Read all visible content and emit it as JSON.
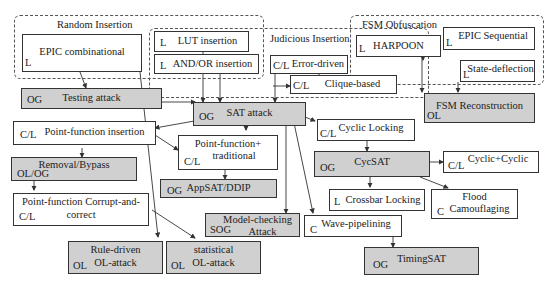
{
  "groups": {
    "random": "Random Insertion",
    "judicious": "Judicious Insertion",
    "fsm": "FSM Obfuscation"
  },
  "nodes": {
    "epic_comb": {
      "label": "EPIC combinational",
      "tag": "L"
    },
    "lut": {
      "label": "LUT insertion",
      "tag": "L"
    },
    "andor": {
      "label": "AND/OR insertion",
      "tag": "L"
    },
    "error_driven": {
      "label": "Error-driven",
      "tag": "C/L"
    },
    "clique": {
      "label": "Clique-based",
      "tag": "C/L"
    },
    "harpoon": {
      "label": "HARPOON",
      "tag": "L"
    },
    "epic_seq": {
      "label": "EPIC Sequential",
      "tag": "L"
    },
    "state_defl": {
      "label": "State-deflection",
      "tag": "L"
    },
    "testing": {
      "label": "Testing attack",
      "tag": "OG"
    },
    "sat": {
      "label": "SAT attack",
      "tag": "OG"
    },
    "fsm_recon": {
      "label": "FSM Reconstruction",
      "tag": "OL"
    },
    "pf_insert": {
      "label": "Point-function insertion",
      "tag": "C/L"
    },
    "pf_trad": {
      "label1": "Point-function+",
      "label2": "traditional",
      "tag": "C/L"
    },
    "cyclic": {
      "label": "Cyclic Locking",
      "tag": "C/L"
    },
    "removal": {
      "label": "Removal/Bypass",
      "tag": "OL/OG"
    },
    "cycsat": {
      "label": "CycSAT",
      "tag": "OG"
    },
    "cyc_cyc": {
      "label": "Cyclic+Cyclic",
      "tag": "C/L"
    },
    "appsat": {
      "label": "AppSAT/DDIP",
      "tag": "OG"
    },
    "crossbar": {
      "label": "Crossbar Locking",
      "tag": "L"
    },
    "flood": {
      "label1": "Flood",
      "label2": "Camouflaging",
      "tag": "C"
    },
    "pf_cac": {
      "label1": "Point-function Corrupt-and-",
      "label2": "correct",
      "tag": "C/L"
    },
    "model_check": {
      "label1": "Model-checking",
      "label2": "Attack",
      "tag": "SOG"
    },
    "wave": {
      "label": "Wave-pipelining",
      "tag": "C"
    },
    "rule": {
      "label1": "Rule-driven",
      "label2": "OL-attack",
      "tag": "OL"
    },
    "stat": {
      "label1": "statistical",
      "label2": "OL-attack",
      "tag": "OL"
    },
    "timingsat": {
      "label": "TimingSAT",
      "tag": "OG"
    }
  }
}
